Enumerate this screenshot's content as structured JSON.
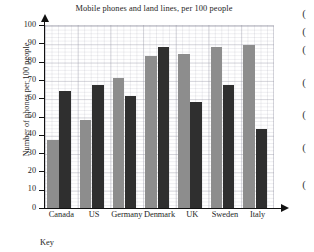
{
  "chart_data": {
    "type": "bar",
    "title": "Mobile phones and land lines, per 100 people",
    "xlabel": "",
    "ylabel": "Number of phones per 100 people",
    "ylim": [
      0,
      100
    ],
    "ytick_step": 10,
    "yticks": [
      "100",
      "90",
      "80",
      "70",
      "60",
      "50",
      "40",
      "30",
      "20",
      "10",
      "0"
    ],
    "grid": true,
    "legend_position": "below-chart",
    "categories": [
      "Canada",
      "US",
      "Germany",
      "Denmark",
      "UK",
      "Sweden",
      "Italy"
    ],
    "series": [
      {
        "name": "Mobile phones",
        "color": "#8d8d8d",
        "values": [
          37,
          48,
          71,
          83,
          84,
          88,
          89
        ]
      },
      {
        "name": "Land lines",
        "color": "#2f2f2f",
        "values": [
          64,
          67,
          61,
          88,
          58,
          67,
          43
        ]
      }
    ]
  },
  "key": {
    "label": "Key"
  },
  "margin_marks": [
    {
      "glyph": "(",
      "top": 8
    },
    {
      "glyph": "(",
      "top": 26
    },
    {
      "glyph": "(",
      "top": 44
    },
    {
      "glyph": "(",
      "top": 77
    },
    {
      "glyph": "(",
      "top": 109
    },
    {
      "glyph": "(",
      "top": 142
    },
    {
      "glyph": "(",
      "top": 179
    }
  ]
}
